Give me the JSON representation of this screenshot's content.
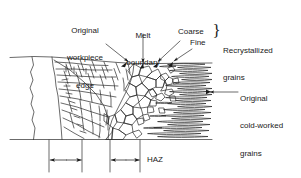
{
  "figure": {
    "type": "technical-diagram",
    "background_color": "#ffffff",
    "line_color": "#2b2b2b",
    "text_color": "#1a1a1a"
  },
  "labels": {
    "original_workpiece_edge": {
      "lines": [
        "Original",
        "workpiece",
        "edge"
      ],
      "line1": "Original",
      "line2": "workpiece",
      "line3": "edge"
    },
    "melt_boundary": {
      "lines": [
        "Melt",
        "boundary"
      ],
      "line1": "Melt",
      "line2": "boundary"
    },
    "coarse": "Coarse",
    "fine": "Fine",
    "recrystallized_grains": {
      "lines": [
        "Recrystallized",
        "grains"
      ],
      "line1": "Recrystallized",
      "line2": "grains"
    },
    "original_cold_worked_grains": {
      "lines": [
        "Original",
        "cold-worked",
        "grains"
      ],
      "line1": "Original",
      "line2": "cold-worked",
      "line3": "grains"
    },
    "haz": "HAZ",
    "brace_glyph": "}"
  },
  "dimensions": [
    {
      "name": "recast-layer-width",
      "label": "",
      "x_start": 49,
      "x_end": 82,
      "y": 160
    },
    {
      "name": "haz-width",
      "label": "HAZ",
      "x_start": 110,
      "x_end": 140,
      "y": 160
    }
  ],
  "callouts": [
    {
      "name": "original-workpiece-edge",
      "arrow": true,
      "target_x": 124,
      "target_y": 64
    },
    {
      "name": "melt-boundary",
      "arrow": true,
      "target_x": 140,
      "target_y": 66
    },
    {
      "name": "coarse-grains",
      "arrow": true,
      "target_x": 154,
      "target_y": 64
    },
    {
      "name": "fine-grains",
      "arrow": true,
      "target_x": 169,
      "target_y": 64
    },
    {
      "name": "original-cold-worked-grains",
      "arrow": true,
      "target_x": 207,
      "target_y": 92
    }
  ],
  "regions": [
    {
      "name": "uncut-base-metal",
      "description": "blank region left of the cut edge"
    },
    {
      "name": "columnar-recast-grains",
      "description": "fan of elongated columnar grains"
    },
    {
      "name": "coarse-equiaxed-grains",
      "description": "polygonal coarse grains"
    },
    {
      "name": "fine-grain-band",
      "description": "narrow band of small grains"
    },
    {
      "name": "cold-worked-grains",
      "description": "horizontally elongated pancake grains"
    }
  ]
}
